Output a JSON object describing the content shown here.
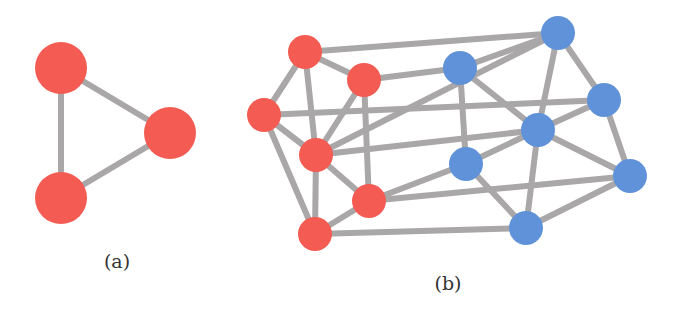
{
  "colors": {
    "red": "#f45b52",
    "blue": "#6092d9",
    "edge": "#a9a7a8",
    "background": "#ffffff"
  },
  "panels": [
    {
      "id": "a",
      "label": "(a)",
      "label_pos": [
        117,
        268
      ],
      "node_radius": 26,
      "nodes": [
        {
          "id": "a1",
          "x": 61,
          "y": 68,
          "color": "red"
        },
        {
          "id": "a2",
          "x": 170,
          "y": 133,
          "color": "red"
        },
        {
          "id": "a3",
          "x": 61,
          "y": 198,
          "color": "red"
        }
      ],
      "edges": [
        [
          "a1",
          "a2"
        ],
        [
          "a2",
          "a3"
        ],
        [
          "a1",
          "a3"
        ]
      ]
    },
    {
      "id": "b",
      "label": "(b)",
      "label_pos": [
        448,
        290
      ],
      "node_radius": 17,
      "nodes": [
        {
          "id": "R1",
          "x": 305,
          "y": 52,
          "color": "red"
        },
        {
          "id": "R2",
          "x": 364,
          "y": 80,
          "color": "red"
        },
        {
          "id": "R3",
          "x": 264,
          "y": 115,
          "color": "red"
        },
        {
          "id": "R4",
          "x": 316,
          "y": 155,
          "color": "red"
        },
        {
          "id": "R5",
          "x": 369,
          "y": 201,
          "color": "red"
        },
        {
          "id": "R6",
          "x": 315,
          "y": 234,
          "color": "red"
        },
        {
          "id": "B1",
          "x": 558,
          "y": 33,
          "color": "blue"
        },
        {
          "id": "B2",
          "x": 460,
          "y": 68,
          "color": "blue"
        },
        {
          "id": "B3",
          "x": 604,
          "y": 100,
          "color": "blue"
        },
        {
          "id": "B4",
          "x": 538,
          "y": 130,
          "color": "blue"
        },
        {
          "id": "B5",
          "x": 466,
          "y": 164,
          "color": "blue"
        },
        {
          "id": "B6",
          "x": 630,
          "y": 176,
          "color": "blue"
        },
        {
          "id": "B7",
          "x": 526,
          "y": 228,
          "color": "blue"
        }
      ],
      "edges": [
        [
          "R1",
          "R2"
        ],
        [
          "R1",
          "R3"
        ],
        [
          "R1",
          "R4"
        ],
        [
          "R2",
          "R4"
        ],
        [
          "R2",
          "R5"
        ],
        [
          "R3",
          "R4"
        ],
        [
          "R3",
          "R6"
        ],
        [
          "R4",
          "R5"
        ],
        [
          "R4",
          "R6"
        ],
        [
          "R5",
          "R6"
        ],
        [
          "R1",
          "B1"
        ],
        [
          "R2",
          "B2"
        ],
        [
          "R3",
          "B3"
        ],
        [
          "R4",
          "B1"
        ],
        [
          "R4",
          "B4"
        ],
        [
          "R5",
          "B5"
        ],
        [
          "R5",
          "B6"
        ],
        [
          "R6",
          "B7"
        ],
        [
          "B1",
          "B2"
        ],
        [
          "B1",
          "B4"
        ],
        [
          "B1",
          "B3"
        ],
        [
          "B2",
          "B4"
        ],
        [
          "B2",
          "B5"
        ],
        [
          "B3",
          "B4"
        ],
        [
          "B3",
          "B6"
        ],
        [
          "B4",
          "B5"
        ],
        [
          "B4",
          "B6"
        ],
        [
          "B4",
          "B7"
        ],
        [
          "B5",
          "B7"
        ],
        [
          "B6",
          "B7"
        ]
      ]
    }
  ]
}
